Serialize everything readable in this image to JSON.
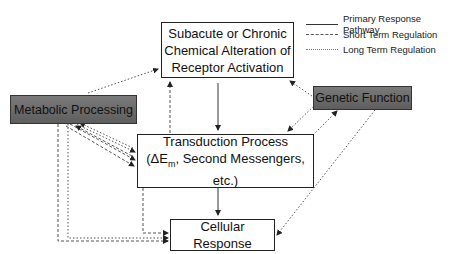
{
  "nodes": {
    "receptor": {
      "lines": [
        "Subacute or Chronic",
        "Chemical Alteration of",
        "Receptor Activation"
      ]
    },
    "metabolic": {
      "label": "Metabolic Processing"
    },
    "genetic": {
      "label": "Genetic Function"
    },
    "transduction": {
      "line1": "Transduction Process",
      "line2_prefix": "(ΔE",
      "line2_sub": "m",
      "line2_suffix": ", Second Messengers, etc.)"
    },
    "cellular": {
      "label": "Cellular Response"
    }
  },
  "legend": [
    {
      "style": "solid",
      "label": "Primary Response Pathway"
    },
    {
      "style": "dashed",
      "label": "Short Term Regulation"
    },
    {
      "style": "dotted",
      "label": "Long Term Regulation"
    }
  ],
  "colors": {
    "box_dark": "#6b6b6b",
    "line": "#333333",
    "background": "#ffffff"
  }
}
